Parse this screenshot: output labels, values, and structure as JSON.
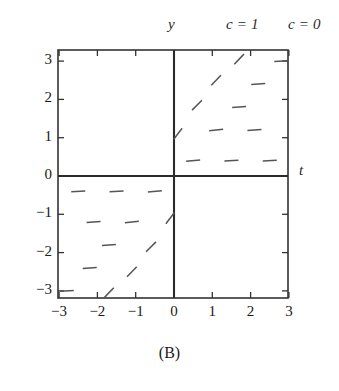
{
  "figure": {
    "caption": "(B)",
    "axis_label_x": "t",
    "axis_label_y": "y",
    "header_labels": [
      {
        "text": "c = 1",
        "id": "c1"
      },
      {
        "text": "c = 0",
        "id": "c0"
      }
    ]
  },
  "chart_data": {
    "type": "scatter",
    "subtype": "slope-field",
    "title": "(B)",
    "xlabel": "t",
    "ylabel": "y",
    "xlim": [
      -3.4,
      3.4
    ],
    "ylim": [
      -3.4,
      3.4
    ],
    "grid": false,
    "legend": null,
    "xticks": [
      -3,
      -2,
      -1,
      0,
      1,
      2,
      3
    ],
    "xticklabels": [
      "−3",
      "−2",
      "−1",
      "0",
      "1",
      "2",
      "3"
    ],
    "yticks": [
      -3,
      -2,
      -1,
      0,
      1,
      2,
      3
    ],
    "yticklabels": [
      "−3",
      "−2",
      "−1",
      "0",
      "1",
      "2",
      "3"
    ],
    "annotations": [
      {
        "text": "c = 1",
        "position": "top-right",
        "style": "italic"
      },
      {
        "text": "c = 0",
        "position": "top-right-clipped",
        "style": "italic"
      }
    ],
    "segment_color": "#555555",
    "segment_length": 14,
    "segments": [
      {
        "t": 0.5,
        "y": 0.4,
        "slope": 0.08
      },
      {
        "t": 1.5,
        "y": 0.4,
        "slope": 0.05
      },
      {
        "t": 2.5,
        "y": 0.4,
        "slope": 0.05
      },
      {
        "t": 0.1,
        "y": 1.1,
        "slope": 1.3
      },
      {
        "t": 1.1,
        "y": 1.2,
        "slope": 0.1
      },
      {
        "t": 2.1,
        "y": 1.2,
        "slope": 0.06
      },
      {
        "t": 0.6,
        "y": 1.85,
        "slope": 1.0
      },
      {
        "t": 1.7,
        "y": 1.8,
        "slope": 0.08
      },
      {
        "t": 1.1,
        "y": 2.5,
        "slope": 1.05
      },
      {
        "t": 2.2,
        "y": 2.4,
        "slope": 0.07
      },
      {
        "t": 1.7,
        "y": 3.05,
        "slope": 1.05
      },
      {
        "t": 2.8,
        "y": 3.0,
        "slope": 0.05
      },
      {
        "t": -0.5,
        "y": -0.4,
        "slope": 0.08
      },
      {
        "t": -1.5,
        "y": -0.4,
        "slope": 0.05
      },
      {
        "t": -2.5,
        "y": -0.4,
        "slope": 0.05
      },
      {
        "t": -0.1,
        "y": -1.1,
        "slope": 1.3
      },
      {
        "t": -1.1,
        "y": -1.2,
        "slope": 0.1
      },
      {
        "t": -2.1,
        "y": -1.2,
        "slope": 0.06
      },
      {
        "t": -0.6,
        "y": -1.85,
        "slope": 1.0
      },
      {
        "t": -1.7,
        "y": -1.8,
        "slope": 0.08
      },
      {
        "t": -1.1,
        "y": -2.5,
        "slope": 1.05
      },
      {
        "t": -2.2,
        "y": -2.4,
        "slope": 0.07
      },
      {
        "t": -1.7,
        "y": -3.05,
        "slope": 1.05
      },
      {
        "t": -2.8,
        "y": -3.0,
        "slope": 0.05
      }
    ]
  },
  "plot_geometry": {
    "left": 58,
    "top": 50,
    "right": 288,
    "bottom": 298,
    "origin_x": 174,
    "origin_y": 176,
    "unit_px_x": 38.3,
    "unit_px_y": 38.3
  }
}
